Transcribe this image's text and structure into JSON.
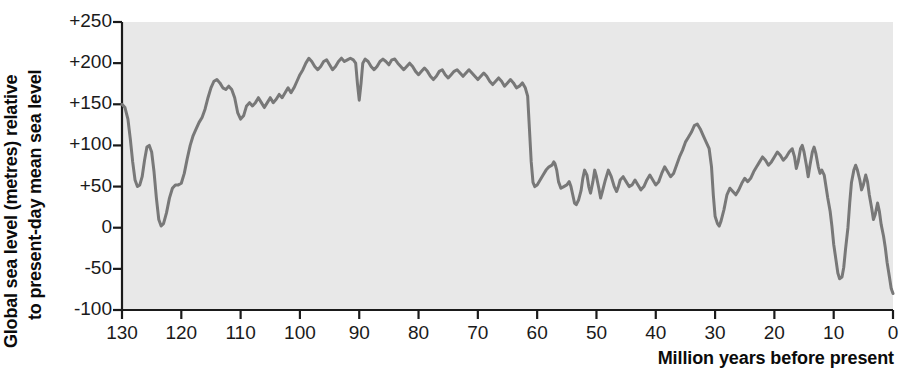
{
  "figure": {
    "background": "#ffffff",
    "plot_background": "#e8e8e8",
    "axis_color": "#1a1a1a",
    "curve_color": "#787878",
    "ylabel_line1": "Global sea level (metres) relative",
    "ylabel_line2": "to present-day mean sea level",
    "xaxis_title": "Million years before present"
  },
  "chart_data": {
    "type": "line",
    "title": "",
    "xlabel": "Million years before present",
    "ylabel": "Global sea level (metres) relative to present-day mean sea level",
    "xlim": [
      130,
      0
    ],
    "ylim": [
      -100,
      250
    ],
    "x_ticks": [
      130,
      120,
      110,
      100,
      90,
      80,
      70,
      60,
      50,
      40,
      30,
      20,
      10,
      0
    ],
    "x_tick_labels": [
      "130",
      "120",
      "110",
      "100",
      "90",
      "80",
      "70",
      "60",
      "50",
      "40",
      "30",
      "20",
      "10",
      "0"
    ],
    "y_ticks": [
      250,
      200,
      150,
      100,
      50,
      0,
      -50,
      -100
    ],
    "y_tick_labels": [
      "+250",
      "+200",
      "+150",
      "+100",
      "+50",
      "0",
      "-50",
      "-100"
    ],
    "x_axis_direction": "reversed",
    "grid": false,
    "legend": false,
    "series": [
      {
        "name": "Global sea level",
        "color": "#787878",
        "x": [
          130.0,
          129.5,
          129.0,
          128.6,
          128.2,
          127.8,
          127.4,
          127.0,
          126.6,
          126.2,
          125.8,
          125.4,
          125.0,
          124.6,
          124.2,
          123.8,
          123.4,
          123.0,
          122.5,
          122.0,
          121.5,
          121.0,
          120.5,
          120.0,
          119.5,
          119.0,
          118.5,
          118.0,
          117.5,
          117.0,
          116.5,
          116.0,
          115.5,
          115.0,
          114.5,
          114.0,
          113.5,
          113.0,
          112.5,
          112.0,
          111.5,
          111.0,
          110.5,
          110.0,
          109.5,
          109.0,
          108.5,
          108.0,
          107.5,
          107.0,
          106.5,
          106.0,
          105.5,
          105.0,
          104.5,
          104.0,
          103.5,
          103.0,
          102.5,
          102.0,
          101.5,
          101.0,
          100.5,
          100.0,
          99.5,
          99.0,
          98.5,
          98.0,
          97.5,
          97.0,
          96.5,
          96.0,
          95.5,
          95.0,
          94.5,
          94.0,
          93.5,
          93.0,
          92.5,
          92.0,
          91.5,
          91.0,
          90.6,
          90.3,
          90.0,
          89.7,
          89.4,
          89.0,
          88.5,
          88.0,
          87.5,
          87.0,
          86.5,
          86.0,
          85.5,
          85.0,
          84.5,
          84.0,
          83.5,
          83.0,
          82.5,
          82.0,
          81.5,
          81.0,
          80.5,
          80.0,
          79.5,
          79.0,
          78.5,
          78.0,
          77.5,
          77.0,
          76.5,
          76.0,
          75.5,
          75.0,
          74.5,
          74.0,
          73.5,
          73.0,
          72.5,
          72.0,
          71.5,
          71.0,
          70.5,
          70.0,
          69.5,
          69.0,
          68.5,
          68.0,
          67.5,
          67.0,
          66.5,
          66.0,
          65.5,
          65.0,
          64.5,
          64.0,
          63.5,
          63.0,
          62.5,
          62.0,
          61.6,
          61.3,
          61.0,
          60.7,
          60.4,
          60.0,
          59.5,
          59.0,
          58.5,
          58.0,
          57.5,
          57.2,
          57.0,
          56.7,
          56.4,
          56.0,
          55.5,
          55.0,
          54.6,
          54.3,
          54.0,
          53.7,
          53.4,
          53.0,
          52.6,
          52.3,
          52.0,
          51.6,
          51.3,
          51.0,
          50.6,
          50.3,
          50.0,
          49.6,
          49.3,
          49.0,
          48.5,
          48.0,
          47.5,
          47.0,
          46.6,
          46.3,
          46.0,
          45.5,
          45.0,
          44.5,
          44.0,
          43.5,
          43.0,
          42.5,
          42.0,
          41.5,
          41.0,
          40.5,
          40.0,
          39.5,
          39.0,
          38.5,
          38.0,
          37.5,
          37.0,
          36.5,
          36.0,
          35.5,
          35.0,
          34.5,
          34.0,
          33.5,
          33.0,
          32.5,
          32.0,
          31.5,
          31.0,
          30.6,
          30.3,
          30.0,
          29.6,
          29.3,
          29.0,
          28.5,
          28.0,
          27.5,
          27.0,
          26.5,
          26.0,
          25.5,
          25.0,
          24.5,
          24.0,
          23.5,
          23.0,
          22.5,
          22.0,
          21.5,
          21.0,
          20.5,
          20.0,
          19.5,
          19.0,
          18.5,
          18.0,
          17.5,
          17.0,
          16.6,
          16.3,
          16.0,
          15.6,
          15.3,
          15.0,
          14.6,
          14.3,
          14.0,
          13.6,
          13.3,
          13.0,
          12.6,
          12.3,
          12.0,
          11.6,
          11.3,
          11.0,
          10.6,
          10.3,
          10.0,
          9.6,
          9.3,
          9.0,
          8.6,
          8.3,
          8.0,
          7.6,
          7.3,
          7.0,
          6.6,
          6.3,
          6.0,
          5.6,
          5.3,
          5.0,
          4.6,
          4.3,
          4.0,
          3.6,
          3.3,
          3.0,
          2.6,
          2.3,
          2.0,
          1.6,
          1.3,
          1.0,
          0.6,
          0.3,
          0.0
        ],
        "y": [
          150,
          146,
          132,
          108,
          80,
          58,
          50,
          52,
          62,
          82,
          98,
          100,
          92,
          68,
          36,
          10,
          2,
          5,
          18,
          36,
          48,
          52,
          52,
          54,
          66,
          84,
          100,
          112,
          120,
          128,
          134,
          144,
          158,
          170,
          178,
          180,
          176,
          170,
          168,
          172,
          168,
          158,
          140,
          132,
          136,
          148,
          152,
          148,
          152,
          158,
          152,
          146,
          152,
          158,
          152,
          156,
          162,
          158,
          164,
          170,
          164,
          170,
          178,
          186,
          192,
          200,
          206,
          202,
          196,
          192,
          196,
          202,
          204,
          198,
          192,
          196,
          202,
          206,
          202,
          204,
          206,
          204,
          200,
          175,
          155,
          175,
          200,
          205,
          202,
          196,
          192,
          196,
          202,
          205,
          202,
          198,
          204,
          205,
          200,
          196,
          192,
          196,
          200,
          196,
          190,
          186,
          190,
          194,
          190,
          184,
          180,
          184,
          190,
          192,
          186,
          182,
          186,
          190,
          192,
          188,
          184,
          188,
          192,
          188,
          184,
          180,
          184,
          188,
          184,
          178,
          174,
          178,
          182,
          178,
          172,
          176,
          180,
          176,
          170,
          172,
          176,
          170,
          160,
          120,
          80,
          55,
          50,
          52,
          58,
          64,
          70,
          74,
          76,
          80,
          78,
          70,
          56,
          48,
          50,
          52,
          56,
          50,
          40,
          30,
          28,
          34,
          45,
          60,
          70,
          64,
          50,
          42,
          56,
          70,
          62,
          48,
          36,
          44,
          58,
          70,
          62,
          50,
          44,
          50,
          58,
          62,
          56,
          50,
          52,
          58,
          52,
          46,
          50,
          58,
          64,
          58,
          52,
          56,
          66,
          74,
          68,
          62,
          66,
          76,
          86,
          94,
          104,
          110,
          116,
          124,
          126,
          120,
          112,
          104,
          96,
          74,
          40,
          14,
          5,
          2,
          8,
          22,
          40,
          48,
          44,
          40,
          46,
          54,
          60,
          56,
          60,
          68,
          74,
          80,
          86,
          82,
          76,
          80,
          86,
          92,
          88,
          82,
          86,
          92,
          96,
          86,
          72,
          80,
          96,
          100,
          92,
          76,
          62,
          76,
          92,
          98,
          90,
          74,
          66,
          70,
          64,
          50,
          36,
          20,
          2,
          -20,
          -40,
          -55,
          -62,
          -60,
          -48,
          -26,
          0,
          30,
          55,
          70,
          76,
          70,
          58,
          46,
          52,
          64,
          56,
          40,
          24,
          10,
          16,
          30,
          20,
          4,
          -10,
          -24,
          -42,
          -60,
          -74,
          -80
        ]
      }
    ],
    "annotations": [
      {
        "approx_x": 130,
        "approx_y": 150,
        "note": "curve starts at +150 at 130 Ma"
      },
      {
        "approx_x": 126.8,
        "approx_y": 50,
        "note": "first trough near +50"
      },
      {
        "approx_x": 125.3,
        "approx_y": 100,
        "note": "rebound to +100"
      },
      {
        "approx_x": 123.4,
        "approx_y": 2,
        "note": "deep minimum near 0 around 123 Ma"
      },
      {
        "approx_x": 99,
        "approx_y": 206,
        "note": "Cretaceous highstand plateau ~+200"
      },
      {
        "approx_x": 90.3,
        "approx_y": 155,
        "note": "narrow spike down to ~+155 at 90 Ma"
      },
      {
        "approx_x": 61,
        "approx_y": 50,
        "note": "abrupt collapse from ~+165 to ~+50 near 61 Ma"
      },
      {
        "approx_x": 34,
        "approx_y": 126,
        "note": "late Eocene peak ~+125"
      },
      {
        "approx_x": 30,
        "approx_y": 2,
        "note": "Oligocene drop to near 0"
      },
      {
        "approx_x": 11,
        "approx_y": -62,
        "note": "late Miocene low ~-60"
      },
      {
        "approx_x": 7,
        "approx_y": 76,
        "note": "Pliocene rise to ~+75"
      },
      {
        "approx_x": 0,
        "approx_y": -80,
        "note": "present-day end of record"
      }
    ]
  }
}
